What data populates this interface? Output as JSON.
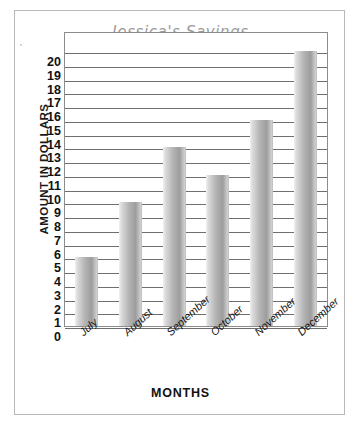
{
  "chart_data": {
    "type": "bar",
    "title": "Jessica's Savings",
    "xlabel": "MONTHS",
    "ylabel": "AMOUNT IN DOLLARS",
    "categories": [
      "July",
      "August",
      "September",
      "October",
      "November",
      "December"
    ],
    "values": [
      5,
      9,
      13,
      11,
      15,
      20
    ],
    "ylim": [
      0,
      20
    ],
    "ytick_step": 1,
    "yticks": [
      20,
      19,
      18,
      17,
      16,
      15,
      14,
      13,
      12,
      11,
      10,
      9,
      8,
      7,
      6,
      5,
      4,
      3,
      2,
      1,
      0
    ],
    "grid": true,
    "legend": false,
    "bar_color": "#b0b0b0",
    "title_color": "#9a9a9a",
    "axis_color": "#8c8c8c",
    "gridline_color": "#6e6e6e",
    "xtick_rotation": -42
  }
}
